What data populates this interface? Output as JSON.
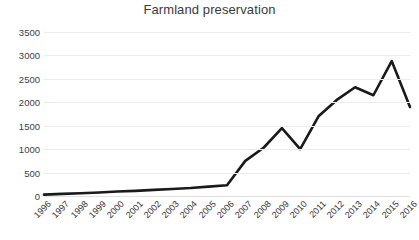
{
  "chart_data": {
    "type": "line",
    "title": "Farmland preservation",
    "xlabel": "",
    "ylabel": "",
    "grid": true,
    "legend": false,
    "line_color": "#1a1a1a",
    "title_color": "#3a3a3a",
    "grid_color": "#ececec",
    "ylim": [
      0,
      3500
    ],
    "yticks": [
      0,
      500,
      1000,
      1500,
      2000,
      2500,
      3000,
      3500
    ],
    "ytick_labels": [
      "0",
      "500",
      "1000",
      "1500",
      "2000",
      "2500",
      "3000",
      "3500"
    ],
    "categories": [
      "1996",
      "1997",
      "1998",
      "1999",
      "2000",
      "2001",
      "2002",
      "2003",
      "2004",
      "2005",
      "2006",
      "2007",
      "2008",
      "2009",
      "2010",
      "2011",
      "2012",
      "2013",
      "2014",
      "2015",
      "2016"
    ],
    "values": [
      30,
      45,
      60,
      75,
      95,
      110,
      130,
      150,
      170,
      200,
      230,
      750,
      1030,
      1450,
      1000,
      1700,
      2050,
      2320,
      2150,
      2880,
      1900
    ]
  }
}
